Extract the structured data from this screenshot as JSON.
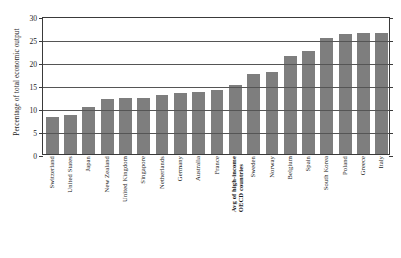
{
  "chart_data": {
    "type": "bar",
    "title": "",
    "subtitle": "",
    "xlabel": "",
    "ylabel": "Percentage of total economic output",
    "ylim": [
      0,
      30
    ],
    "yticks": [
      0,
      5,
      10,
      15,
      20,
      25,
      30
    ],
    "ytick_labels": [
      "0",
      "5",
      "10",
      "15",
      "20",
      "25",
      "30"
    ],
    "grid": true,
    "legend": false,
    "legend_position": "none",
    "bar_color": "#7e7e7e",
    "categories": [
      "Switzerland",
      "United States",
      "Japan",
      "New Zealand",
      "United Kingdom",
      "Singapore",
      "Netherlands",
      "Germany",
      "Australia",
      "France",
      "Avg of high-income OECD countries",
      "Sweden",
      "Norway",
      "Belgium",
      "Spain",
      "South Korea",
      "Poland",
      "Greece",
      "Italy"
    ],
    "values": [
      8.0,
      8.4,
      10.3,
      12.0,
      12.1,
      12.1,
      12.9,
      13.2,
      13.4,
      14.0,
      15.0,
      17.5,
      17.8,
      21.3,
      22.5,
      25.3,
      26.0,
      26.3,
      26.4
    ],
    "highlighted_category": "Avg of high-income OECD countries"
  },
  "axis": {
    "y_title": "Percentage of total economic output"
  },
  "x_label_lines": [
    [
      "Switzerland"
    ],
    [
      "United States"
    ],
    [
      "Japan"
    ],
    [
      "New Zealand"
    ],
    [
      "United Kingdom"
    ],
    [
      "Singapore"
    ],
    [
      "Netherlands"
    ],
    [
      "Germany"
    ],
    [
      "Australia"
    ],
    [
      "France"
    ],
    [
      "Avg of high-income",
      "OECD countries"
    ],
    [
      "Sweden"
    ],
    [
      "Norway"
    ],
    [
      "Belgium"
    ],
    [
      "Spain"
    ],
    [
      "South Korea"
    ],
    [
      "Poland"
    ],
    [
      "Greece"
    ],
    [
      "Italy"
    ]
  ]
}
